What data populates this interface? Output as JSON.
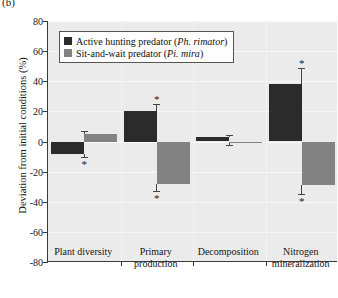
{
  "panel_letter": "(b)",
  "chart_data": {
    "type": "bar",
    "title": "",
    "xlabel": "",
    "ylabel": "Deviation from initial conditions (%)",
    "ylim": [
      -80,
      80
    ],
    "yticks": [
      80,
      60,
      40,
      20,
      0,
      -20,
      -40,
      -60,
      -80
    ],
    "ytick_labels": [
      "80",
      "60",
      "40",
      "20",
      "0",
      "-20",
      "-40",
      "-60",
      "-80"
    ],
    "grid": true,
    "legend_position": "upper-left",
    "categories": [
      "Plant diversity",
      "Primary production",
      "Decomposition",
      "Nitrogen mineralization"
    ],
    "category_lines": [
      [
        "Plant diversity"
      ],
      [
        "Primary",
        "production"
      ],
      [
        "Decomposition"
      ],
      [
        "Nitrogen",
        "mineralization"
      ]
    ],
    "series": [
      {
        "name": "Active hunting predator (Ph. rimator)",
        "name_plain": "Active hunting predator",
        "species": "Ph. rimator",
        "color": "#2b2b2b",
        "values": [
          -8,
          20,
          3,
          38
        ],
        "errors": [
          2,
          5,
          1,
          11
        ],
        "significant": [
          true,
          true,
          false,
          true
        ]
      },
      {
        "name": "Sit-and-wait predator (Pi. mira)",
        "name_plain": "Sit-and-wait predator",
        "species": "Pi. mira",
        "color": "#828282",
        "values": [
          5,
          -28,
          -1,
          -29
        ],
        "errors": [
          2,
          5,
          1,
          6
        ],
        "significant": [
          false,
          true,
          false,
          true
        ]
      }
    ],
    "significance_marker": "*"
  },
  "legend": {
    "items": [
      {
        "label": "Active hunting predator (",
        "species": "Ph. rimator",
        "tail": ")",
        "color": "#2b2b2b"
      },
      {
        "label": "Sit-and-wait predator (",
        "species": "Pi. mira",
        "tail": ")",
        "color": "#828282"
      }
    ]
  }
}
